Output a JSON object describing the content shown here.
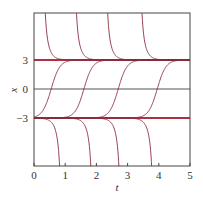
{
  "chart_data": {
    "type": "line",
    "title": "",
    "xlabel": "t",
    "ylabel": "x",
    "xlim": [
      0,
      5
    ],
    "ylim": [
      -8,
      8
    ],
    "xticks": [
      "0",
      "1",
      "2",
      "3",
      "4",
      "5"
    ],
    "yticks": [
      "3",
      "0",
      "-3"
    ],
    "grid": false,
    "equilibria": [
      {
        "x": 3,
        "color": "#b03040",
        "style": "thick"
      },
      {
        "x": 0,
        "color": "#555555",
        "style": "thin"
      },
      {
        "x": -3,
        "color": "#b03040",
        "style": "thick"
      }
    ],
    "series": [
      {
        "name": "above-3 start 0.25",
        "description": "descends from top toward x=3",
        "t_vertical": 0.25
      },
      {
        "name": "above-3 start 1.25",
        "t_vertical": 1.25
      },
      {
        "name": "above-3 start 2.25",
        "t_vertical": 2.25
      },
      {
        "name": "above-3 start 3.35",
        "t_vertical": 3.35
      },
      {
        "name": "middle crossing 0.55",
        "description": "rises from -3 to 3",
        "t_cross_zero": 0.55
      },
      {
        "name": "middle crossing 1.6",
        "t_cross_zero": 1.6
      },
      {
        "name": "middle crossing 2.7",
        "t_cross_zero": 2.7
      },
      {
        "name": "middle crossing 3.95",
        "t_cross_zero": 3.95
      },
      {
        "name": "below-3 drop 0.9",
        "description": "leaves -3 toward -infinity",
        "t_bottom": 0.9
      },
      {
        "name": "below-3 drop 1.9",
        "t_bottom": 1.9
      },
      {
        "name": "below-3 drop 2.8",
        "t_bottom": 2.8
      },
      {
        "name": "below-3 drop 3.85",
        "t_bottom": 3.85
      }
    ],
    "curve_color": "#8a3040"
  }
}
